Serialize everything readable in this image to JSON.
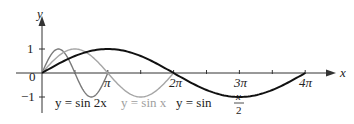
{
  "chart_data": {
    "type": "line",
    "title": "",
    "xlabel": "x",
    "ylabel": "y",
    "xlim": [
      0,
      12.566
    ],
    "ylim": [
      -1,
      1
    ],
    "x_ticks": [
      "π",
      "2π",
      "3π",
      "4π"
    ],
    "x_tick_values": [
      3.1416,
      6.2832,
      9.4248,
      12.5664
    ],
    "minor_x_ticks": [
      1.5708,
      4.7124,
      7.854,
      10.9956
    ],
    "y_ticks": [
      "1",
      "0",
      "−1"
    ],
    "y_tick_values": [
      1,
      0,
      -1
    ],
    "grid": false,
    "series": [
      {
        "name": "y = sin 2x",
        "function": "sin(2x)",
        "domain": [
          0,
          3.1416
        ],
        "color": "#7a7a7a",
        "x": [
          0,
          0.785,
          1.571,
          2.356,
          3.142
        ],
        "values": [
          0,
          1,
          0,
          -1,
          0
        ]
      },
      {
        "name": "y = sin x",
        "function": "sin(x)",
        "domain": [
          0,
          6.2832
        ],
        "color": "#a6a6a6",
        "x": [
          0,
          1.571,
          3.142,
          4.712,
          6.283
        ],
        "values": [
          0,
          1,
          0,
          -1,
          0
        ]
      },
      {
        "name": "y = sin x/2",
        "function": "sin(x/2)",
        "domain": [
          0,
          12.5664
        ],
        "color": "#111111",
        "x": [
          0,
          3.142,
          6.283,
          9.425,
          12.566
        ],
        "values": [
          0,
          1,
          0,
          -1,
          0
        ]
      }
    ]
  },
  "labels": {
    "y_axis": "y",
    "x_axis": "x",
    "origin": "0",
    "y_one": "1",
    "y_neg_one": "−1",
    "pi": "π",
    "two_pi": "2π",
    "three_pi": "3π",
    "four_pi": "4π",
    "sin2x_label": "y = sin 2x",
    "sinx_label": "y = sin x",
    "sinhalf_prefix": "y = sin",
    "sinhalf_num": "x",
    "sinhalf_den": "2"
  }
}
